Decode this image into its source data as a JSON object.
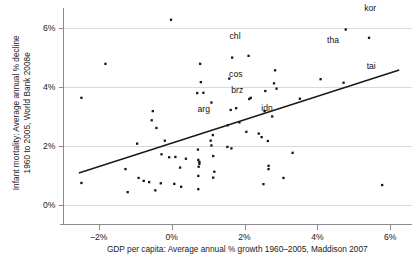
{
  "chart_data": {
    "type": "scatter",
    "title": "",
    "xlabel": "GDP per capita: Average annual % growth 1960–2005, Maddison 2007",
    "ylabel": "Infant mortality: Average annual % decline 1960 to 2005, World Bank 2008e",
    "xlim": [
      -3.0,
      6.6
    ],
    "ylim": [
      -0.35,
      6.6
    ],
    "xticks": [
      -2,
      0,
      2,
      4,
      6
    ],
    "xticklabels": [
      "-2%",
      "0%",
      "2%",
      "4%",
      "6%"
    ],
    "yticks": [
      0,
      2,
      4,
      6
    ],
    "yticklabels": [
      "0%",
      "2%",
      "4%",
      "6%"
    ],
    "grid": "horizontal",
    "legend": "none",
    "trendline": {
      "x0": -2.55,
      "y0": 1.09,
      "x1": 6.25,
      "y1": 4.57
    },
    "annotations": [
      {
        "label": "kor",
        "x": 5.45,
        "y": 6.55
      },
      {
        "label": "chl",
        "x": 1.74,
        "y": 5.62
      },
      {
        "label": "tha",
        "x": 4.43,
        "y": 5.5
      },
      {
        "label": "tai",
        "x": 5.48,
        "y": 4.62
      },
      {
        "label": "cos",
        "x": 1.76,
        "y": 4.35
      },
      {
        "label": "brz",
        "x": 1.8,
        "y": 3.78
      },
      {
        "label": "arg",
        "x": 0.88,
        "y": 3.15
      },
      {
        "label": "idn",
        "x": 2.62,
        "y": 3.2
      }
    ],
    "points": [
      {
        "x": -0.02,
        "y": 6.27
      },
      {
        "x": 4.78,
        "y": 5.94
      },
      {
        "x": 5.42,
        "y": 5.66
      },
      {
        "x": -1.82,
        "y": 4.78
      },
      {
        "x": 0.78,
        "y": 4.78
      },
      {
        "x": 1.66,
        "y": 4.99
      },
      {
        "x": 2.11,
        "y": 5.05
      },
      {
        "x": 2.84,
        "y": 4.56
      },
      {
        "x": 4.09,
        "y": 4.26
      },
      {
        "x": 1.58,
        "y": 4.28
      },
      {
        "x": 0.8,
        "y": 4.16
      },
      {
        "x": 4.72,
        "y": 4.14
      },
      {
        "x": 2.81,
        "y": 4.12
      },
      {
        "x": -2.48,
        "y": 3.63
      },
      {
        "x": 0.7,
        "y": 3.79
      },
      {
        "x": 0.87,
        "y": 3.8
      },
      {
        "x": 2.57,
        "y": 3.86
      },
      {
        "x": 2.88,
        "y": 3.94
      },
      {
        "x": 2.17,
        "y": 3.63
      },
      {
        "x": 2.13,
        "y": 3.59
      },
      {
        "x": 3.52,
        "y": 3.6
      },
      {
        "x": 1.09,
        "y": 3.47
      },
      {
        "x": -0.52,
        "y": 3.18
      },
      {
        "x": 1.62,
        "y": 3.22
      },
      {
        "x": 1.77,
        "y": 3.28
      },
      {
        "x": 2.55,
        "y": 3.18
      },
      {
        "x": 2.76,
        "y": 3.0
      },
      {
        "x": -0.55,
        "y": 2.87
      },
      {
        "x": 1.86,
        "y": 2.8
      },
      {
        "x": 1.54,
        "y": 2.7
      },
      {
        "x": -0.42,
        "y": 2.61
      },
      {
        "x": 2.05,
        "y": 2.48
      },
      {
        "x": 2.39,
        "y": 2.42
      },
      {
        "x": 1.13,
        "y": 2.37
      },
      {
        "x": 2.47,
        "y": 2.3
      },
      {
        "x": 1.07,
        "y": 2.18
      },
      {
        "x": -0.19,
        "y": 2.18
      },
      {
        "x": -0.95,
        "y": 2.08
      },
      {
        "x": 1.09,
        "y": 2.02
      },
      {
        "x": 1.53,
        "y": 1.97
      },
      {
        "x": 1.64,
        "y": 1.92
      },
      {
        "x": 2.64,
        "y": 2.17
      },
      {
        "x": 3.32,
        "y": 1.77
      },
      {
        "x": 0.72,
        "y": 1.88
      },
      {
        "x": -0.28,
        "y": 1.72
      },
      {
        "x": 1.14,
        "y": 1.66
      },
      {
        "x": -0.07,
        "y": 1.62
      },
      {
        "x": 0.1,
        "y": 1.63
      },
      {
        "x": 0.39,
        "y": 1.57
      },
      {
        "x": 0.73,
        "y": 1.53
      },
      {
        "x": 0.76,
        "y": 1.46
      },
      {
        "x": 0.76,
        "y": 1.4
      },
      {
        "x": -1.27,
        "y": 1.22
      },
      {
        "x": 0.23,
        "y": 1.27
      },
      {
        "x": 0.74,
        "y": 1.3
      },
      {
        "x": 0.73,
        "y": 0.99
      },
      {
        "x": 1.14,
        "y": 0.93
      },
      {
        "x": 1.17,
        "y": 1.13
      },
      {
        "x": 2.66,
        "y": 1.33
      },
      {
        "x": 2.66,
        "y": 1.22
      },
      {
        "x": 3.07,
        "y": 0.92
      },
      {
        "x": -0.91,
        "y": 0.92
      },
      {
        "x": -0.77,
        "y": 0.82
      },
      {
        "x": -0.62,
        "y": 0.78
      },
      {
        "x": -0.3,
        "y": 0.74
      },
      {
        "x": 0.07,
        "y": 0.72
      },
      {
        "x": 0.26,
        "y": 0.62
      },
      {
        "x": 0.73,
        "y": 0.54
      },
      {
        "x": -0.45,
        "y": 0.5
      },
      {
        "x": -1.21,
        "y": 0.44
      },
      {
        "x": -2.48,
        "y": 0.75
      },
      {
        "x": 2.52,
        "y": 0.71
      },
      {
        "x": 5.78,
        "y": 0.68
      }
    ]
  }
}
